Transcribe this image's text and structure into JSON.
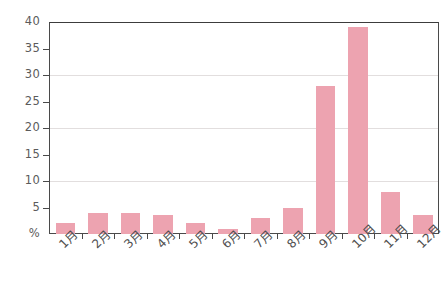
{
  "chart_data": {
    "type": "bar",
    "title": "",
    "subtitle": "",
    "xlabel": "",
    "ylabel": "%",
    "categories": [
      "1月",
      "2月",
      "3月",
      "4月",
      "5月",
      "6月",
      "7月",
      "8月",
      "9月",
      "10月",
      "11月",
      "12月"
    ],
    "values": [
      2,
      4,
      4,
      3.5,
      2,
      1,
      3,
      5,
      28,
      39,
      8,
      3.5
    ],
    "ylim": [
      0,
      40
    ],
    "ytick_labels": [
      "40",
      "35",
      "30",
      "25",
      "20",
      "15",
      "10",
      "5",
      "%"
    ],
    "ytick_values": [
      40,
      35,
      30,
      25,
      20,
      15,
      10,
      5,
      0
    ],
    "gridlines": [
      30,
      20,
      10
    ],
    "grid": true,
    "legend": "none",
    "bar_color": "#eda3b0",
    "axis_color": "#4a4a4a",
    "grid_color": "#e2dede",
    "label_color": "#5b5b5b",
    "background": "#ffffff"
  }
}
